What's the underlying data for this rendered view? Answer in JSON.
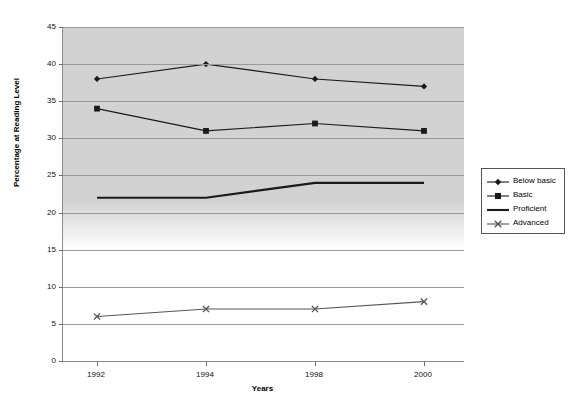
{
  "chart_data": {
    "type": "line",
    "title": "Percentage of Students at each Reading Level (NAEP) during the Years 1992, 1994, 1998 and 2000",
    "xlabel": "Years",
    "ylabel": "Percentage at Reading Level",
    "categories": [
      "1992",
      "1994",
      "1998",
      "2000"
    ],
    "ylim": [
      0,
      45
    ],
    "yticks": [
      0,
      5,
      10,
      15,
      20,
      25,
      30,
      35,
      40,
      45
    ],
    "grid": true,
    "legend_position": "right",
    "series": [
      {
        "name": "Below basic",
        "marker": "diamond",
        "values": [
          38,
          40,
          38,
          37
        ]
      },
      {
        "name": "Basic",
        "marker": "square",
        "values": [
          34,
          31,
          32,
          31
        ]
      },
      {
        "name": "Proficient",
        "marker": "none",
        "values": [
          22,
          22,
          24,
          24
        ]
      },
      {
        "name": "Advanced",
        "marker": "x",
        "values": [
          6,
          7,
          7,
          8
        ]
      }
    ]
  },
  "legend": {
    "items": [
      {
        "label": "Below basic"
      },
      {
        "label": "Basic"
      },
      {
        "label": "Proficient"
      },
      {
        "label": "Advanced"
      }
    ]
  },
  "colors": {
    "series_line": "#1a1a1a",
    "advanced_line": "#555555",
    "plot_background": "#d2d2d2",
    "gridline": "#9a9a9a",
    "axis": "#8d8d8d"
  }
}
